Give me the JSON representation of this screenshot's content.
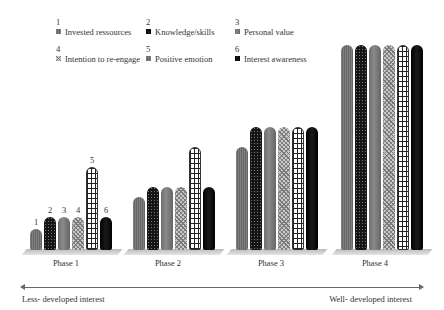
{
  "legend": [
    {
      "num": "1",
      "label": "Invested ressources",
      "pattern": "fine"
    },
    {
      "num": "2",
      "label": "Knowledge/skills",
      "pattern": "dots"
    },
    {
      "num": "3",
      "label": "Personal value",
      "pattern": "grey"
    },
    {
      "num": "4",
      "label": "Intention to re-engage",
      "pattern": "diag"
    },
    {
      "num": "5",
      "label": "Positive emotion",
      "pattern": "grid"
    },
    {
      "num": "6",
      "label": "Interest awareness",
      "pattern": "black"
    }
  ],
  "phases": [
    "Phase 1",
    "Phase 2",
    "Phase 3",
    "Phase 4"
  ],
  "phase1_bar_numbers": [
    "1",
    "2",
    "3",
    "4",
    "5",
    "6"
  ],
  "axis": {
    "left_caption": "Less- developed interest",
    "right_caption": "Well- developed interest"
  },
  "chart_data": {
    "type": "bar",
    "title": "",
    "categories": [
      "Phase 1",
      "Phase 2",
      "Phase 3",
      "Phase 4"
    ],
    "series": [
      {
        "name": "Invested ressources",
        "values": [
          21,
          53,
          103,
          205
        ]
      },
      {
        "name": "Knowledge/skills",
        "values": [
          33,
          63,
          123,
          205
        ]
      },
      {
        "name": "Personal value",
        "values": [
          33,
          63,
          123,
          205
        ]
      },
      {
        "name": "Intention to re-engage",
        "values": [
          33,
          63,
          123,
          205
        ]
      },
      {
        "name": "Positive emotion",
        "values": [
          83,
          103,
          123,
          205
        ]
      },
      {
        "name": "Interest awareness",
        "values": [
          33,
          63,
          123,
          205
        ]
      }
    ],
    "xlabel": "Less- developed interest → Well- developed interest",
    "ylabel": "",
    "grid": false,
    "legend_position": "top"
  }
}
